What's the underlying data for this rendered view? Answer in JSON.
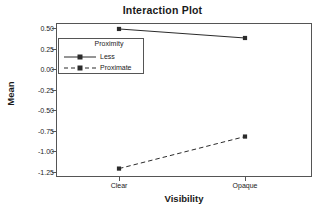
{
  "chart_data": {
    "type": "line",
    "title": "Interaction Plot",
    "xlabel": "Visibility",
    "ylabel": "Mean",
    "categories": [
      "Clear",
      "Opaque"
    ],
    "ylim": [
      -1.3125,
      0.5625
    ],
    "yticks": [
      "0.50",
      "0.25",
      "0.00",
      "-0.25",
      "-0.50",
      "-0.75",
      "-1.00",
      "-1.25"
    ],
    "ytick_values": [
      0.5,
      0.25,
      0.0,
      -0.25,
      -0.5,
      -0.75,
      -1.0,
      -1.25
    ],
    "grid": false,
    "legend_position": "upper-left-inside",
    "legend_title": "Proximity",
    "series": [
      {
        "name": "Less",
        "values": [
          0.49,
          0.38
        ],
        "line_style": "solid",
        "marker": "square",
        "color": "#2b2b2b"
      },
      {
        "name": "Proximate",
        "values": [
          -1.21,
          -0.82
        ],
        "line_style": "dashed",
        "marker": "square",
        "color": "#2b2b2b"
      }
    ]
  },
  "chart": {
    "title": "Interaction Plot",
    "xaxis_title": "Visibility",
    "yaxis_title": "Mean",
    "xtick_labels": [
      "Clear",
      "Opaque"
    ],
    "ytick_labels": [
      "0.50",
      "0.25",
      "0.00",
      "-0.25",
      "-0.50",
      "-0.75",
      "-1.00",
      "-1.25"
    ],
    "legend": {
      "title": "Proximity",
      "items": [
        {
          "label": "Less"
        },
        {
          "label": "Proximate"
        }
      ]
    }
  },
  "colors": {
    "axis": "#555555",
    "text": "#1a1a1a",
    "series": "#2b2b2b",
    "background": "#ffffff"
  }
}
